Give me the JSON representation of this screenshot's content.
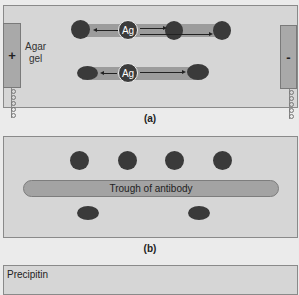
{
  "panel_a": {
    "caption": "(a)",
    "agar_label_line1": "Agar",
    "agar_label_line2": "gel",
    "anode_symbol": "+",
    "cathode_symbol": "-",
    "antigen_label": "Ag",
    "wire_glyphs": "ooooo"
  },
  "panel_b": {
    "caption": "(b)",
    "trough_label": "Trough of antibody"
  },
  "panel_c": {
    "label": "Precipitin"
  },
  "colors": {
    "background": "#ebebeb",
    "gel": "#d6d6d6",
    "electrode": "#a9a9a9",
    "band": "#9c9c9c",
    "well": "#3a3a3a"
  }
}
